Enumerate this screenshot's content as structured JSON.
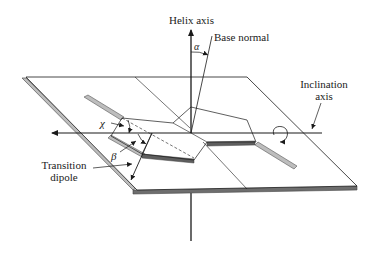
{
  "figure": {
    "type": "diagram",
    "labels": {
      "helix_axis": "Helix axis",
      "base_normal": "Base normal",
      "alpha": "α",
      "inclination_axis_line1": "Inclination",
      "inclination_axis_line2": "axis",
      "chi": "χ",
      "beta": "β",
      "transition_dipole_line1": "Transition",
      "transition_dipole_line2": "dipole"
    },
    "colors": {
      "line": "#1a1a1a",
      "plane_edge_light": "#b5b5b5",
      "plane_edge_dark": "#666666",
      "background": "#ffffff"
    }
  }
}
